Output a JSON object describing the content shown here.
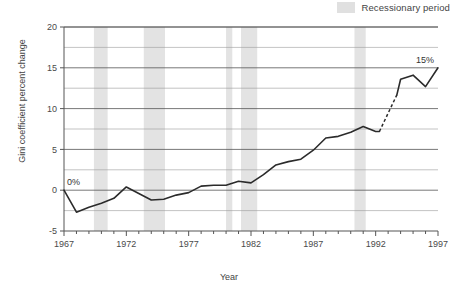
{
  "legend": {
    "label": "Recessionary period",
    "swatch_color": "#e0e0e0"
  },
  "axis": {
    "x_title": "Year",
    "y_title": "Gini coefficient percent change"
  },
  "chart_data": {
    "type": "line",
    "title": "",
    "subtitle": "",
    "xlabel": "Year",
    "ylabel": "Gini coefficient percent change",
    "xlim": [
      1967,
      1997
    ],
    "ylim": [
      -5,
      20
    ],
    "x_major_ticks": [
      1967,
      1972,
      1977,
      1982,
      1987,
      1992,
      1997
    ],
    "x_tick_labels": [
      "1967",
      "1972",
      "1977",
      "1982",
      "1987",
      "1992",
      "1997"
    ],
    "x_minor_tick_step": 1,
    "y_major_ticks": [
      -5,
      0,
      5,
      10,
      15,
      20
    ],
    "y_tick_labels": [
      "-5",
      "0",
      "5",
      "10",
      "15",
      "20"
    ],
    "y_minor_gridlines": [
      -2.5,
      2.5,
      7.5,
      12.5,
      17.5
    ],
    "grid": "horizontal",
    "legend_position": "top-right",
    "line_color": "#2b2b2b",
    "x": [
      1967,
      1968,
      1969,
      1970,
      1971,
      1972,
      1973,
      1974,
      1975,
      1976,
      1977,
      1978,
      1979,
      1980,
      1981,
      1982,
      1983,
      1984,
      1985,
      1986,
      1987,
      1988,
      1989,
      1990,
      1991,
      1992,
      1993,
      1994,
      1995,
      1996,
      1997
    ],
    "values": [
      0.0,
      -2.7,
      -2.1,
      -1.6,
      -1.0,
      0.4,
      -0.4,
      -1.2,
      -1.1,
      -0.6,
      -0.3,
      0.5,
      0.6,
      0.6,
      1.1,
      0.9,
      1.9,
      3.1,
      3.5,
      3.8,
      4.9,
      6.4,
      6.6,
      7.1,
      7.8,
      7.2,
      7.2,
      13.6,
      14.1,
      12.7,
      15.0
    ],
    "dashed_segment_x": [
      1992.3,
      1993.7
    ],
    "dashed_segment_note": "Break in series between 1992 and 1993 shown as dashed line",
    "annotations": [
      {
        "text": "0%",
        "x": 1967,
        "y": 0.0,
        "position": "above-right"
      },
      {
        "text": "15%",
        "x": 1997,
        "y": 15.0,
        "position": "above-left"
      }
    ],
    "shaded_regions": [
      {
        "label": "Recessionary period",
        "x0": 1969.4,
        "x1": 1970.5
      },
      {
        "label": "Recessionary period",
        "x0": 1973.4,
        "x1": 1975.1
      },
      {
        "label": "Recessionary period",
        "x0": 1980.0,
        "x1": 1980.5
      },
      {
        "label": "Recessionary period",
        "x0": 1981.2,
        "x1": 1982.5
      },
      {
        "label": "Recessionary period",
        "x0": 1990.3,
        "x1": 1991.2
      }
    ],
    "shaded_color": "#e3e3e3"
  }
}
